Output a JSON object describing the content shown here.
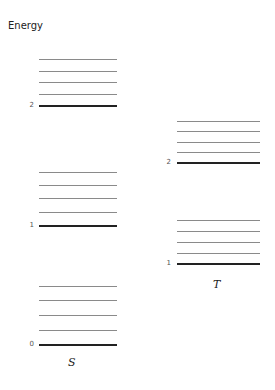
{
  "title": "Energy",
  "manifolds": [
    {
      "label": "S",
      "x": 39,
      "width": 78,
      "label_x": 68,
      "label_y": 356,
      "label_num_x": 22,
      "levels": [
        {
          "n": "2",
          "y": 106,
          "vib": [
            59,
            71,
            82,
            94
          ]
        },
        {
          "n": "1",
          "y": 226,
          "vib": [
            172,
            185,
            198,
            212
          ]
        },
        {
          "n": "0",
          "y": 345,
          "vib": [
            286,
            300,
            315,
            330
          ]
        }
      ]
    },
    {
      "label": "T",
      "x": 177,
      "width": 83,
      "label_x": 213,
      "label_y": 278,
      "label_num_x": 159,
      "levels": [
        {
          "n": "2",
          "y": 163,
          "vib": [
            121,
            131,
            142,
            152
          ]
        },
        {
          "n": "1",
          "y": 264,
          "vib": [
            220,
            231,
            242,
            253
          ]
        }
      ]
    }
  ]
}
